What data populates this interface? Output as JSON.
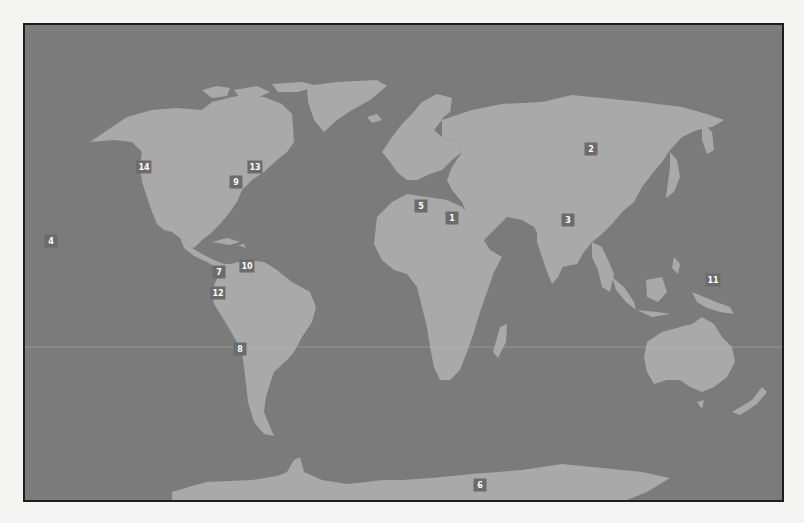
{
  "map": {
    "colors": {
      "ocean": "#7b7b7b",
      "land": "#a9a9a9",
      "marker_bg": "#6b6b6b",
      "marker_text": "#ffffff",
      "frame": "#1e1e1e"
    },
    "markers": [
      {
        "label": "1",
        "x": 452,
        "y": 218
      },
      {
        "label": "2",
        "x": 591,
        "y": 149
      },
      {
        "label": "3",
        "x": 568,
        "y": 220
      },
      {
        "label": "4",
        "x": 51,
        "y": 241
      },
      {
        "label": "5",
        "x": 421,
        "y": 206
      },
      {
        "label": "6",
        "x": 480,
        "y": 485
      },
      {
        "label": "7",
        "x": 219,
        "y": 272
      },
      {
        "label": "8",
        "x": 240,
        "y": 349
      },
      {
        "label": "9",
        "x": 236,
        "y": 182
      },
      {
        "label": "10",
        "x": 247,
        "y": 266
      },
      {
        "label": "11",
        "x": 713,
        "y": 280
      },
      {
        "label": "12",
        "x": 218,
        "y": 293
      },
      {
        "label": "13",
        "x": 255,
        "y": 167
      },
      {
        "label": "14",
        "x": 144,
        "y": 167
      }
    ]
  }
}
